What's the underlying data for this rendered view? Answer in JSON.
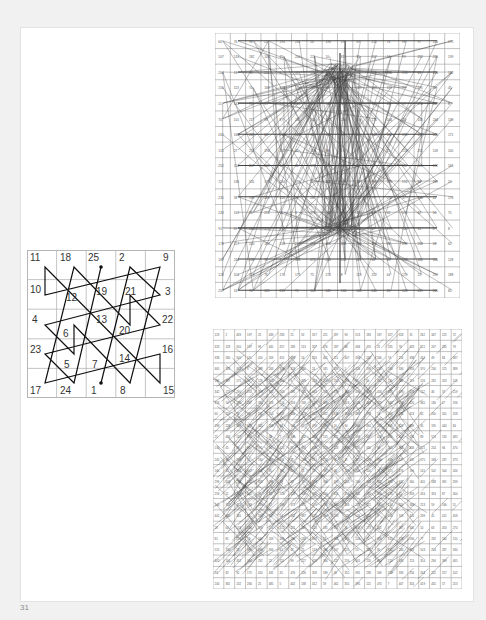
{
  "page": {
    "number": "31",
    "background": "#f1f1f1",
    "frame_color": "#ffffff"
  },
  "figures": {
    "magic_square_5": {
      "size": 5,
      "cells": [
        [
          11,
          18,
          25,
          2,
          9
        ],
        [
          10,
          12,
          19,
          21,
          3
        ],
        [
          4,
          6,
          13,
          20,
          22
        ],
        [
          23,
          5,
          7,
          14,
          16
        ],
        [
          17,
          24,
          1,
          8,
          15
        ]
      ],
      "labels": [
        {
          "n": "11",
          "x": 3,
          "y": 3
        },
        {
          "n": "18",
          "x": 33,
          "y": 3
        },
        {
          "n": "25",
          "x": 61,
          "y": 3
        },
        {
          "n": "2",
          "x": 92,
          "y": 3
        },
        {
          "n": "9",
          "x": 136,
          "y": 3
        },
        {
          "n": "10",
          "x": 3,
          "y": 35
        },
        {
          "n": "12",
          "x": 39,
          "y": 43
        },
        {
          "n": "19",
          "x": 69,
          "y": 37
        },
        {
          "n": "21",
          "x": 98,
          "y": 37
        },
        {
          "n": "3",
          "x": 138,
          "y": 37
        },
        {
          "n": "4",
          "x": 5,
          "y": 65
        },
        {
          "n": "6",
          "x": 36,
          "y": 79
        },
        {
          "n": "13",
          "x": 69,
          "y": 65
        },
        {
          "n": "20",
          "x": 92,
          "y": 76
        },
        {
          "n": "22",
          "x": 135,
          "y": 65
        },
        {
          "n": "23",
          "x": 3,
          "y": 95
        },
        {
          "n": "5",
          "x": 37,
          "y": 110
        },
        {
          "n": "7",
          "x": 65,
          "y": 110
        },
        {
          "n": "14",
          "x": 92,
          "y": 104
        },
        {
          "n": "16",
          "x": 135,
          "y": 95
        },
        {
          "n": "17",
          "x": 3,
          "y": 136
        },
        {
          "n": "24",
          "x": 33,
          "y": 136
        },
        {
          "n": "1",
          "x": 64,
          "y": 136
        },
        {
          "n": "8",
          "x": 93,
          "y": 136
        },
        {
          "n": "15",
          "x": 136,
          "y": 136
        }
      ],
      "path": [
        [
          74,
          133
        ],
        [
          103,
          17
        ],
        [
          133,
          45
        ],
        [
          18,
          75
        ],
        [
          47,
          104
        ],
        [
          47,
          75
        ],
        [
          103,
          133
        ],
        [
          133,
          17
        ],
        [
          18,
          45
        ],
        [
          18,
          17
        ],
        [
          133,
          133
        ],
        [
          133,
          104
        ],
        [
          18,
          133
        ],
        [
          47,
          17
        ],
        [
          103,
          75
        ],
        [
          103,
          45
        ],
        [
          133,
          75
        ],
        [
          18,
          104
        ],
        [
          47,
          133
        ],
        [
          74,
          17
        ]
      ],
      "start_dot": [
        74,
        133
      ],
      "end_dot": [
        74,
        17
      ],
      "line_color": "#111111"
    },
    "magic_square_top": {
      "columns": 16,
      "rows": 17,
      "line_color": "#222222",
      "grid_color": "#9a9a9a",
      "convergence_points": [
        [
          125,
          37
        ],
        [
          125,
          197
        ]
      ]
    },
    "magic_square_bottom": {
      "columns": 23,
      "rows": 23,
      "line_color": "#222222",
      "grid_color": "#9a9a9a"
    }
  }
}
